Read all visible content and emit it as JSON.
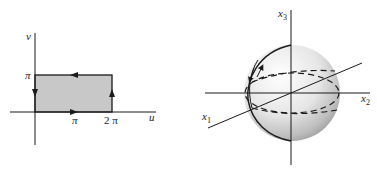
{
  "left_diagram": {
    "axes": {
      "horizontal_label": "u",
      "vertical_label": "v"
    },
    "ticks": {
      "v_pi": "π",
      "u_pi": "π",
      "u_2pi": "2 π"
    },
    "region": {
      "shape": "rectangle",
      "u_range": [
        "0",
        "2π"
      ],
      "v_range": [
        "0",
        "π"
      ],
      "fill_color": "#c8c8c8",
      "orientation": "counterclockwise"
    }
  },
  "right_diagram": {
    "object": "sphere",
    "axes": {
      "x1": {
        "base": "x",
        "sub": "1"
      },
      "x2": {
        "base": "x",
        "sub": "2"
      },
      "x3": {
        "base": "x",
        "sub": "3"
      }
    },
    "features": [
      "solid meridian",
      "dashed equator",
      "dashed parallel circle",
      "orientation arrows"
    ]
  },
  "colors": {
    "stroke": "#1a1a1a",
    "rect_fill": "#c8c8c8",
    "sphere_highlight": "#ffffff",
    "sphere_shadow": "#9a9a9a"
  }
}
